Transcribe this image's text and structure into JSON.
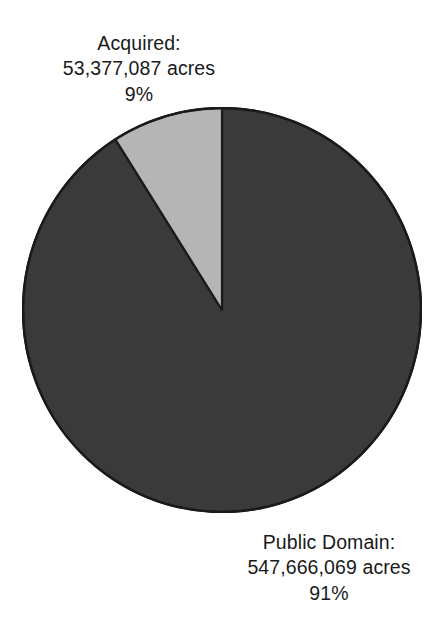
{
  "figure": {
    "background_color": "#ffffff",
    "text_color": "#1a1a1a"
  },
  "chart_data": {
    "type": "pie",
    "title": "",
    "subtitle": "",
    "xlabel": "",
    "ylabel": "",
    "grid": false,
    "legend_position": "none",
    "units": "acres",
    "total_acres": "601,043,156",
    "start_angle_deg": 0,
    "direction": "clockwise",
    "categories": [
      "Public Domain",
      "Acquired"
    ],
    "values": [
      547666069,
      53377087
    ],
    "percentages": [
      91,
      9
    ],
    "slices": [
      {
        "name": "Public Domain",
        "label_title": "Public Domain:",
        "label_value": "547,666,069 acres",
        "label_percent": "91%",
        "value": 547666069,
        "percent": 91,
        "color": "#3a3a3a",
        "edge_color": "#1a1a1a"
      },
      {
        "name": "Acquired",
        "label_title": "Acquired:",
        "label_value": "53,377,087 acres",
        "label_percent": "9%",
        "value": 53377087,
        "percent": 9,
        "color": "#b5b5b5",
        "edge_color": "#1a1a1a"
      }
    ]
  },
  "labels": {
    "acquired": {
      "title": "Acquired:",
      "value": "53,377,087 acres",
      "percent": "9%"
    },
    "public_domain": {
      "title": "Public Domain:",
      "value": "547,666,069 acres",
      "percent": "91%"
    }
  }
}
